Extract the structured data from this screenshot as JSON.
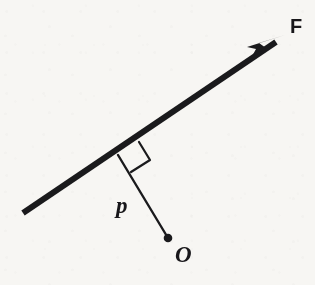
{
  "figure": {
    "kind": "mechanics-moment-diagram",
    "background_color": "#f7f6f3",
    "ink_color": "#1a1a1c",
    "labels": {
      "force": "F",
      "moment_arm": "p",
      "pivot": "O"
    },
    "elements": {
      "force_line_name": "line of action of F",
      "arrow_name": "force-arrowhead",
      "perpendicular_name": "perpendicular moment arm p",
      "right_angle_name": "right-angle marker",
      "pivot_dot_name": "pivot point O"
    },
    "geometry": {
      "force_line_start": [
        23,
        213
      ],
      "force_line_end": [
        283,
        37
      ],
      "arrow_tip": [
        285,
        36
      ],
      "perp_foot": [
        118,
        155
      ],
      "pivot_point": [
        168,
        238
      ],
      "right_angle_corner_a": [
        138,
        142
      ],
      "right_angle_corner_b": [
        148,
        159
      ],
      "right_angle_corner_c": [
        130,
        171
      ],
      "force_line_width": 6,
      "perp_line_width": 2.2,
      "pivot_dot_radius": 4.2
    }
  }
}
